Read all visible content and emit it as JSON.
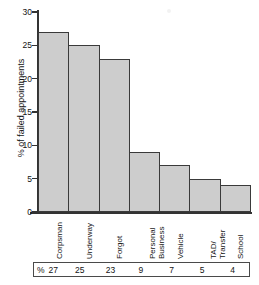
{
  "chart_data": {
    "type": "bar",
    "title": "",
    "xlabel": "",
    "ylabel": "% of failed appointments",
    "ylim": [
      0,
      30
    ],
    "yticks": [
      0,
      5,
      10,
      15,
      20,
      25,
      30
    ],
    "ytick_labels": [
      "0",
      "5",
      "10",
      "15",
      "20",
      "25",
      "30"
    ],
    "grid": false,
    "legend": "none",
    "categories": [
      "Corpsman",
      "Underway",
      "Forgot",
      "Personal Business",
      "Vehicle",
      "TAD/Transfer",
      "School"
    ],
    "category_lines": [
      [
        "Corpsman"
      ],
      [
        "Underway"
      ],
      [
        "Forgot"
      ],
      [
        "Personal",
        "Business"
      ],
      [
        "Vehicle"
      ],
      [
        "TAD/",
        "Transfer"
      ],
      [
        "School"
      ]
    ],
    "values": [
      27,
      25,
      23,
      9,
      7,
      5,
      4
    ],
    "bar_fill_color": "#cdcdcd",
    "bar_edge_color": "#3a3a3a",
    "axis_color": "#333333"
  },
  "value_table": {
    "unit_symbol": "%",
    "values": [
      "27",
      "25",
      "23",
      "9",
      "7",
      "5",
      "4"
    ]
  }
}
